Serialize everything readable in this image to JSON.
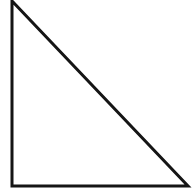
{
  "figure": {
    "name": "right-triangle-figure",
    "shape_type": "right triangle",
    "description": "Outline drawing of a right triangle with the right angle at the bottom-left corner",
    "background_color": "#ffffff",
    "stroke_color": "#151515",
    "fill_color": "none",
    "stroke_width": 3,
    "canvas": {
      "width": 192,
      "height": 195
    },
    "vertices": [
      {
        "label": "apex-top-left",
        "x": 12,
        "y": 1
      },
      {
        "label": "right-angle-bottom-left",
        "x": 12,
        "y": 186
      },
      {
        "label": "vertex-bottom-right",
        "x": 188,
        "y": 186
      }
    ],
    "edges": [
      {
        "label": "vertical-leg",
        "from": "apex-top-left",
        "to": "right-angle-bottom-left"
      },
      {
        "label": "horizontal-leg-base",
        "from": "right-angle-bottom-left",
        "to": "vertex-bottom-right"
      },
      {
        "label": "hypotenuse",
        "from": "apex-top-left",
        "to": "vertex-bottom-right"
      }
    ],
    "points_path": "12,1 12,186 188,186"
  }
}
